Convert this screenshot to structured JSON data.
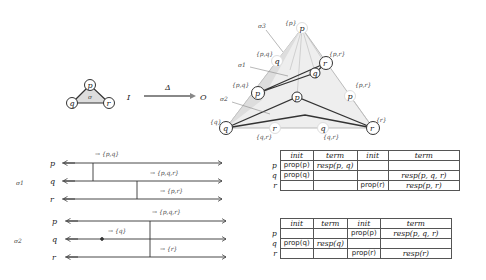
{
  "top": {
    "input_complex": {
      "vertices": [
        "p",
        "q",
        "r"
      ],
      "simplex_label": "σ"
    },
    "map": {
      "from": "I",
      "to": "O",
      "label": "Δ"
    },
    "output_complex": {
      "corner_labels": {
        "top": "{p}",
        "left": "{q}",
        "right": "{r}"
      },
      "edge_labels": [
        "{p,q}",
        "{p,q}",
        "{p,r}",
        "{p,r}",
        "{q,r}",
        "{q,r}"
      ],
      "simplex_labels": [
        "σ3",
        "σ1",
        "σ2"
      ],
      "vertices": [
        "p",
        "q",
        "r",
        "p",
        "q",
        "r",
        "p",
        "q",
        "p",
        "r",
        "q",
        "r"
      ]
    }
  },
  "executions": [
    {
      "label": "σ1",
      "processes": [
        "p",
        "q",
        "r"
      ],
      "annotations": [
        "→ {p,q}",
        "→ {p,q,r}",
        "→ {p,r}"
      ]
    },
    {
      "label": "σ2",
      "processes": [
        "p",
        "q",
        "r"
      ],
      "annotations": [
        "→ {p,q,r}",
        "→ {q}",
        "→ {r}"
      ]
    }
  ],
  "tables": [
    {
      "headers": [
        "init",
        "term",
        "init",
        "term"
      ],
      "rows": [
        {
          "proc": "p",
          "cells": [
            "prop(p)",
            "resp(p, q)",
            "",
            ""
          ]
        },
        {
          "proc": "q",
          "cells": [
            "prop(q)",
            "",
            "",
            "resp(p, q, r)"
          ]
        },
        {
          "proc": "r",
          "cells": [
            "",
            "",
            "prop(r)",
            "resp(p, r)"
          ]
        }
      ]
    },
    {
      "headers": [
        "init",
        "term",
        "init",
        "term"
      ],
      "rows": [
        {
          "proc": "p",
          "cells": [
            "",
            "",
            "prop(p)",
            "resp(p, q, r)"
          ]
        },
        {
          "proc": "q",
          "cells": [
            "prop(q)",
            "resp(q)",
            "",
            ""
          ]
        },
        {
          "proc": "r",
          "cells": [
            "",
            "",
            "prop(r)",
            "resp(r)"
          ]
        }
      ]
    }
  ]
}
